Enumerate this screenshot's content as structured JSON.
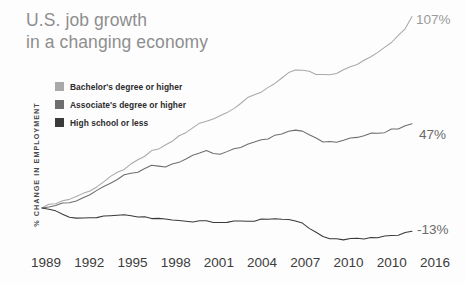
{
  "title": {
    "line1": "U.S. job growth",
    "line2": "in a changing economy"
  },
  "legend": {
    "items": [
      {
        "label": "Bachelor's degree or higher",
        "color": "#a9a9a9"
      },
      {
        "label": "Associate's degree or higher",
        "color": "#6e6e6e"
      },
      {
        "label": "High school or less",
        "color": "#3a3a3a"
      }
    ]
  },
  "axes": {
    "y_label": "% CHANGE IN EMPLOYMENT",
    "x_ticks": [
      "1989",
      "1992",
      "1995",
      "1998",
      "2001",
      "2004",
      "2007",
      "2010",
      "2010",
      "2016"
    ]
  },
  "end_labels": [
    {
      "text": "107%",
      "color": "#9a9a9a"
    },
    {
      "text": "47%",
      "color": "#6a6a6a"
    },
    {
      "text": "-13%",
      "color": "#6a6a6a"
    }
  ],
  "chart_data": {
    "type": "line",
    "title": "U.S. job growth in a changing economy",
    "xlabel": "",
    "ylabel": "% CHANGE IN EMPLOYMENT",
    "xlim": [
      1989,
      2016
    ],
    "ylim": [
      -20,
      112
    ],
    "grid": false,
    "legend_position": "upper-left-inside",
    "x_tick_labels": [
      "1989",
      "1992",
      "1995",
      "1998",
      "2001",
      "2004",
      "2007",
      "2010",
      "2010",
      "2016"
    ],
    "x": [
      1989,
      1989.5,
      1990,
      1990.5,
      1991,
      1991.5,
      1992,
      1992.5,
      1993,
      1993.5,
      1994,
      1994.5,
      1995,
      1995.5,
      1996,
      1996.5,
      1997,
      1997.5,
      1998,
      1998.5,
      1999,
      1999.5,
      2000,
      2000.5,
      2001,
      2001.5,
      2002,
      2002.5,
      2003,
      2003.5,
      2004,
      2004.5,
      2005,
      2005.5,
      2006,
      2006.5,
      2007,
      2007.5,
      2008,
      2008.5,
      2009,
      2009.5,
      2010,
      2010.5,
      2011,
      2011.5,
      2012,
      2012.5,
      2013,
      2013.5,
      2014,
      2014.5,
      2015,
      2015.5,
      2016
    ],
    "series": [
      {
        "name": "Bachelor's degree or higher",
        "color": "#a9a9a9",
        "end_value": 107,
        "end_label": "107%",
        "values": [
          0,
          1.5,
          3,
          4,
          5,
          6.5,
          8,
          10,
          12,
          14.5,
          17,
          19.5,
          22,
          24,
          26.5,
          29,
          31.5,
          33,
          35,
          37.5,
          40,
          42,
          44.5,
          47.5,
          49,
          50,
          51.5,
          54,
          56,
          58.5,
          61,
          63,
          65,
          67.5,
          70,
          72.5,
          75,
          76.5,
          77,
          76,
          74.5,
          74,
          74.5,
          75.5,
          77,
          78.5,
          80.5,
          82.5,
          85,
          87.5,
          90,
          93,
          96,
          100,
          107
        ]
      },
      {
        "name": "Associate's degree or higher",
        "color": "#6e6e6e",
        "end_value": 47,
        "end_label": "47%",
        "values": [
          0,
          1,
          2,
          2.5,
          3,
          4.5,
          6,
          8,
          10,
          12,
          14,
          16,
          18,
          19,
          20.5,
          22,
          23.5,
          23,
          22.5,
          24,
          26,
          28,
          29.5,
          31,
          31.5,
          31,
          30.5,
          31.5,
          32.5,
          34,
          35.5,
          36.5,
          37.5,
          39,
          40.5,
          42,
          43.5,
          43.5,
          43,
          41,
          38.5,
          37,
          36.5,
          37,
          37.5,
          38.5,
          40,
          41,
          41.5,
          42,
          42.5,
          43.5,
          44.5,
          46,
          47
        ]
      },
      {
        "name": "High school or less",
        "color": "#3a3a3a",
        "end_value": -13,
        "end_label": "-13%",
        "values": [
          0,
          -1,
          -2,
          -3.5,
          -5,
          -5.5,
          -6,
          -5.5,
          -5,
          -4.5,
          -4,
          -4,
          -4,
          -4.5,
          -5,
          -5,
          -5.5,
          -6,
          -6.5,
          -7,
          -7,
          -7.5,
          -7.5,
          -7,
          -7.5,
          -8,
          -8.5,
          -8,
          -7.5,
          -7.5,
          -7,
          -7,
          -6.5,
          -6.5,
          -6,
          -6,
          -6.5,
          -7,
          -8.5,
          -11,
          -14,
          -16,
          -17,
          -17.5,
          -17.5,
          -17,
          -17,
          -17,
          -16.5,
          -16.5,
          -16,
          -15.5,
          -15,
          -14,
          -13
        ]
      }
    ]
  }
}
